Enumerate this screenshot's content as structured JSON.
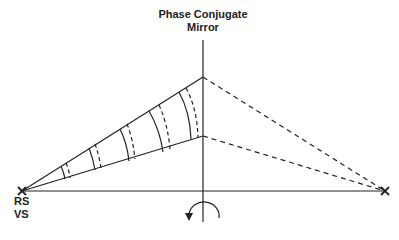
{
  "diagram": {
    "title_line1": "Phase Conjugate",
    "title_line2": "Mirror",
    "source_label_line1": "RS",
    "source_label_line2": "VS",
    "colors": {
      "line": "#222222",
      "background": "#ffffff"
    },
    "elements": {
      "source_point": {
        "x": 22,
        "y": 191,
        "marker": "x"
      },
      "target_point": {
        "x": 385,
        "y": 191,
        "marker": "x"
      },
      "mirror": {
        "x": 203,
        "y_top": 20,
        "y_bottom": 222
      },
      "beam_upper_hit": {
        "x": 203,
        "y": 77
      },
      "beam_lower_hit": {
        "x": 203,
        "y": 136
      },
      "wavefront_pairs": 5,
      "rotation_arrow": "counterclockwise-semicircle"
    }
  }
}
